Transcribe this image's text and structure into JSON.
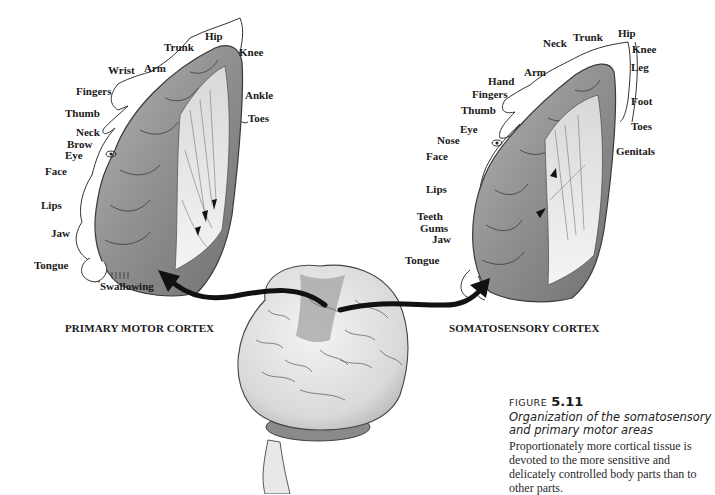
{
  "figure": {
    "left_panel": {
      "title": "PRIMARY MOTOR CORTEX",
      "labels": [
        "Hip",
        "Trunk",
        "Knee",
        "Wrist",
        "Arm",
        "Fingers",
        "Ankle",
        "Toes",
        "Thumb",
        "Neck",
        "Brow",
        "Eye",
        "Face",
        "Lips",
        "Jaw",
        "Tongue",
        "Swallowing"
      ]
    },
    "right_panel": {
      "title": "SOMATOSENSORY CORTEX",
      "labels": [
        "Hip",
        "Neck",
        "Trunk",
        "Knee",
        "Leg",
        "Arm",
        "Hand",
        "Fingers",
        "Foot",
        "Thumb",
        "Toes",
        "Eye",
        "Nose",
        "Face",
        "Genitals",
        "Lips",
        "Teeth",
        "Gums",
        "Jaw",
        "Tongue"
      ]
    },
    "caption": {
      "prefix": "FIGURE",
      "number": "5.11",
      "title": "Organization of the somatosensory and primary motor areas",
      "body": "Proportionately more cortical tissue is devoted to the more sensitive and delicately controlled body parts than to other parts."
    }
  },
  "colors": {
    "cortex_fill": "#9a9a9a",
    "cortex_shadow": "#6e6e6e",
    "brain_fill": "#e4e4e4",
    "highlight_strip": "#a8a8a8",
    "arrow": "#111111"
  }
}
